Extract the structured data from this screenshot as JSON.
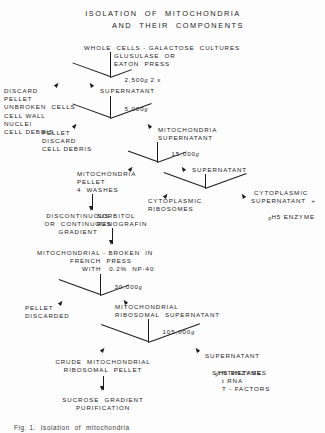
{
  "figure": {
    "title_line1": "ISOLATION  OF  MITOCHONDRIA",
    "title_line2": "AND  THEIR  COMPONENTS",
    "caption": "Fig. 1.  Isolation  of  mitochondria"
  },
  "nodes": {
    "start": "WHOLE  CELLS - GALACTOSE  CULTURES",
    "lysis_method_1": "GLUSULASE  OR",
    "lysis_method_2": "EATON  PRESS",
    "spin_1": "2,500",
    "spin_1_unit": "g",
    "spin_1_times": "2 x",
    "discard_pellet": "DISCARD\nPELLET\nUNBROKEN  CELLS\nCELL WALL\nNUCLEI\nCELL DEBRIS",
    "supernatant_1": "SUPERNATANT",
    "spin_2": "5,000",
    "spin_2_unit": "g",
    "pellet_discard_debris": "PELLET\nDISCARD\nCELL DEBRIS",
    "mito_supernatant": "MITOCHONDRIA\nSUPERNATANT",
    "spin_3": "15,000",
    "spin_3_unit": "g",
    "mito_pellet": "MITOCHONDRIA\nPELLET\n4  WASHES",
    "supernatant_2": "SUPERNATANT",
    "cyto_ribosomes": "CYTOPLASMIC\nRIBOSOMES",
    "cyto_supernatant_l1": "CYTOPLASMIC",
    "cyto_supernatant_l2": "SUPERNATANT  +",
    "cyto_supernatant_l3_sub": "p",
    "cyto_supernatant_l3_main": "H5 ENZYME",
    "gradient_left": "DISCONTINUOUS\nOR  CONTINUOUS\nGRADIENT",
    "gradient_right": "SORBITOL\nRENOGRAFIN",
    "french_press_l1": "MITOCHONDRIAL - BROKEN  IN",
    "french_press_l2": "FRENCH  PRESS",
    "french_press_l3": "WITH   0.2%  NP-40",
    "spin_4": "30,000",
    "spin_4_unit": "g",
    "pellet_discarded": "PELLET\nDISCARDED",
    "mito_ribosomal_sup": "MITOCHONDRIAL\nRIBOSOMAL  SUPERNATANT",
    "spin_5": "105,000",
    "spin_5_unit": "g",
    "crude_pellet": "CRUDE  MITOCHONDRIAL\nRIBOSOMAL  PELLET",
    "sucrose": "SUCROSE  GRADIENT\nPURIFICATION",
    "final_supernatant": "SUPERNATANT",
    "final_ph5_sub": "p",
    "final_ph5_main": "H5 ENZYME",
    "final_synthetases": "SYNTHETASES",
    "final_trna": "t RNA",
    "final_tfactors": "T - FACTORS"
  },
  "colors": {
    "ink": "#1c1c1c",
    "paper": "#fdfdfd"
  }
}
